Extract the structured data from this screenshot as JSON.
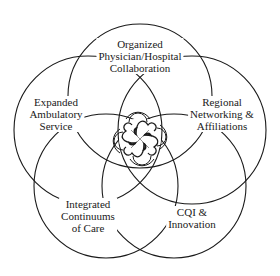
{
  "diagram": {
    "type": "five-circle-venn",
    "stroke_color": "#1a1a1a",
    "background": "#ffffff",
    "center_emblem": "interlocking-quatrefoil-knot-icon",
    "circles": [
      {
        "id": "top",
        "label_lines": [
          "Organized",
          "Physician/Hospital",
          "Collaboration"
        ]
      },
      {
        "id": "left",
        "label_lines": [
          "Expanded",
          "Ambulatory",
          "Service"
        ]
      },
      {
        "id": "right",
        "label_lines": [
          "Regional",
          "Networking &",
          "Affiliations"
        ]
      },
      {
        "id": "bottom-left",
        "label_lines": [
          "Integrated",
          "Continuums",
          "of Care"
        ]
      },
      {
        "id": "bottom-right",
        "label_lines": [
          "CQI &",
          "Innovation"
        ]
      }
    ]
  }
}
